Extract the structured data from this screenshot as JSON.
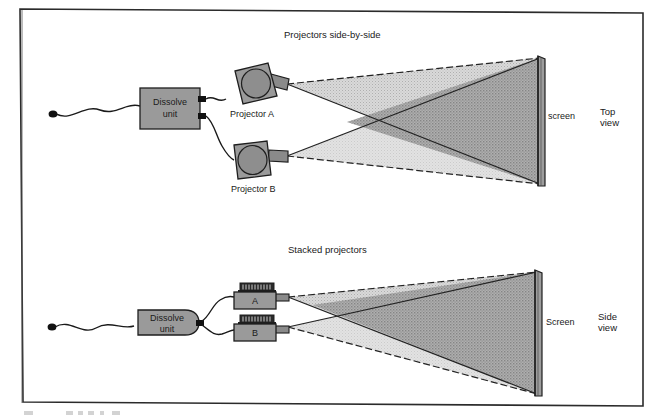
{
  "figure": {
    "page_border_color": "#2b2b2b",
    "background_color": "#ffffff",
    "caption_clipped": ""
  },
  "palette": {
    "device_fill": "#9a9a9a",
    "device_stroke": "#1e1e1e",
    "lens_fill": "#8e8e8e",
    "beam_a_fill": "#a8a8a8",
    "beam_b_fill": "#d2d2d2",
    "beam_overlap_fill": "#8a8a8a",
    "beam_edge": "#232323",
    "screen_fill": "#9d9d9d",
    "screen_edge": "#1e1e1e",
    "cable_color": "#1a1a1a",
    "tray_fill": "#2a2a2a"
  },
  "top_view": {
    "title": "Projectors side-by-side",
    "dissolve_unit": {
      "line1": "Dissolve",
      "line2": "unit"
    },
    "projector_a_label": "Projector A",
    "projector_b_label": "Projector B",
    "screen_label": "screen",
    "view_label_line1": "Top",
    "view_label_line2": "view",
    "icons": {
      "projector": "projector-top-icon",
      "plug": "cable-plug-icon",
      "cable": "cable-icon",
      "screen": "screen-icon",
      "beam_a": "light-beam-a",
      "beam_b": "light-beam-b"
    }
  },
  "side_view": {
    "title": "Stacked projectors",
    "dissolve_unit": {
      "line1": "Dissolve",
      "line2": "unit"
    },
    "projector_a_label": "A",
    "projector_b_label": "B",
    "screen_label": "Screen",
    "view_label_line1": "Side",
    "view_label_line2": "view",
    "icons": {
      "projector": "projector-side-icon",
      "slide_tray": "slide-tray-icon",
      "plug": "cable-plug-icon",
      "cable": "cable-icon",
      "screen": "screen-icon",
      "beam_a": "light-beam-a",
      "beam_b": "light-beam-b"
    }
  }
}
